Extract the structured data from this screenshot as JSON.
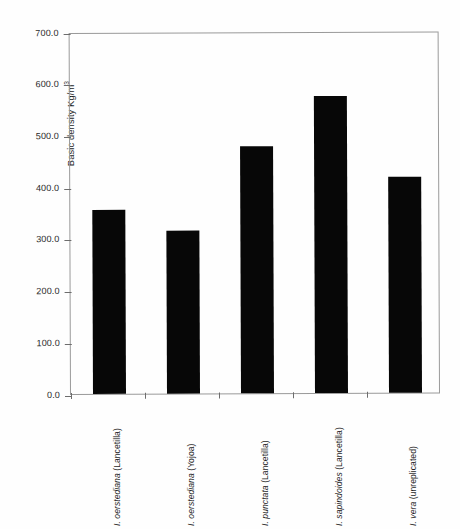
{
  "chart_data": {
    "type": "bar",
    "title": "",
    "subtitle": "",
    "xlabel": "",
    "ylabel": "Basic density Kg/m",
    "ylabel_superscript": "3",
    "ylim": [
      0,
      700
    ],
    "ytick_labels": [
      "700.0",
      "600.0",
      "500.0",
      "400.0",
      "300.0",
      "200.0",
      "100.0",
      "0.0"
    ],
    "ytick_values": [
      700,
      600,
      500,
      400,
      300,
      200,
      100,
      0
    ],
    "ytick_interval": 100,
    "grid": false,
    "legend": false,
    "bar_color": "#070707",
    "axis_color": "#9a9a9a",
    "categories": [
      "I. oerstediana (Lancetilla)",
      "I. oerstediana (Yojoa)",
      "I. punctata (Lancetilla)",
      "I. sapindoides (Lancetilla)",
      "I. vera (unreplicated)"
    ],
    "category_parts": [
      {
        "species": "I. oerstediana",
        "site": "(Lancetilla)"
      },
      {
        "species": "I. oerstediana",
        "site": "(Yojoa)"
      },
      {
        "species": "I. punctata",
        "site": "(Lancetilla)"
      },
      {
        "species": "I. sapindoides",
        "site": "(Lancetilla)"
      },
      {
        "species": "I. vera",
        "site": "(unreplicated)"
      }
    ],
    "values": [
      355,
      315,
      478,
      574,
      418
    ]
  }
}
